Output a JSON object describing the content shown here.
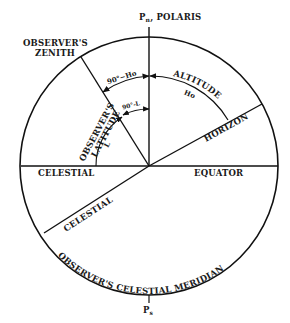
{
  "diagram": {
    "labels": {
      "north_pole": "P",
      "north_pole_sub": "n",
      "north_pole_suffix": ", POLARIS",
      "zenith_line1": "OBSERVER'S",
      "zenith_line2": "ZENITH",
      "co_altitude": "90°−Ho",
      "altitude": "ALTITUDE",
      "altitude_symbol": "Ho",
      "co_latitude": "90°-L",
      "observers_latitude_line1": "OBSERVER'S",
      "observers_latitude_line2": "LATITUDE",
      "latitude_symbol": "L",
      "horizon": "HORIZON",
      "celestial_left": "CELESTIAL",
      "equator": "EQUATOR",
      "celestial_lower": "CELESTIAL",
      "meridian": "OBSERVER'S  CELESTIAL  MERIDIAN",
      "south_pole": "P",
      "south_pole_sub": "s"
    },
    "geometry": {
      "center": [
        149,
        166
      ],
      "radius": 129,
      "zenith_point": [
        81,
        56
      ],
      "horizon_point": [
        262,
        104
      ],
      "equator_lower_point": [
        42,
        232
      ]
    },
    "colors": {
      "ink": "#111111",
      "background": "#ffffff"
    }
  }
}
